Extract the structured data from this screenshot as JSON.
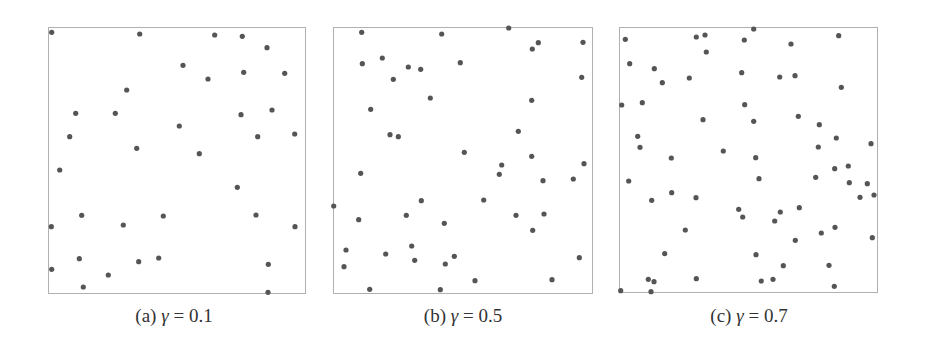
{
  "figure": {
    "dot_color": "#555555",
    "frame_color": "#b0b0b0",
    "dot_radius": 2.6
  },
  "chart_data": [
    {
      "type": "scatter",
      "title": "",
      "caption": {
        "label": "(a)",
        "symbol": "γ",
        "equals": "=",
        "value": "0.1"
      },
      "gamma": 0.1,
      "frame": {
        "x": 48,
        "y": 27,
        "w": 257,
        "h": 266
      },
      "axes": "none",
      "grid": false,
      "legend": "none",
      "points": [
        [
          51.7,
          32.3
        ],
        [
          139.7,
          34
        ],
        [
          214.7,
          35
        ],
        [
          242.3,
          36.3
        ],
        [
          267,
          47.7
        ],
        [
          183,
          65.3
        ],
        [
          243.7,
          72.3
        ],
        [
          284.7,
          73.3
        ],
        [
          208,
          79
        ],
        [
          126.7,
          90
        ],
        [
          75.7,
          113.3
        ],
        [
          115.3,
          113.3
        ],
        [
          272,
          110
        ],
        [
          241,
          114.7
        ],
        [
          179.3,
          126
        ],
        [
          69.7,
          136.7
        ],
        [
          257.7,
          136.7
        ],
        [
          294.7,
          134
        ],
        [
          136.7,
          148.3
        ],
        [
          199.3,
          153.7
        ],
        [
          59.7,
          170
        ],
        [
          237.3,
          187.3
        ],
        [
          81.7,
          215.3
        ],
        [
          163.3,
          216
        ],
        [
          256,
          215
        ],
        [
          51.3,
          226.7
        ],
        [
          123.3,
          225
        ],
        [
          295,
          226.7
        ],
        [
          79.3,
          258.7
        ],
        [
          138.7,
          261.7
        ],
        [
          158.7,
          258
        ],
        [
          268.3,
          264.3
        ],
        [
          51.7,
          269.3
        ],
        [
          108.3,
          275
        ],
        [
          83.3,
          287
        ],
        [
          268,
          292.3
        ]
      ]
    },
    {
      "type": "scatter",
      "title": "",
      "caption": {
        "label": "(b)",
        "symbol": "γ",
        "equals": "=",
        "value": "0.5"
      },
      "gamma": 0.5,
      "frame": {
        "x": 333,
        "y": 27,
        "w": 259,
        "h": 266
      },
      "axes": "none",
      "grid": false,
      "legend": "none",
      "points": [
        [
          361.7,
          32.3
        ],
        [
          441.7,
          34
        ],
        [
          508.7,
          28
        ],
        [
          538.3,
          42.7
        ],
        [
          532.3,
          49
        ],
        [
          583,
          42.3
        ],
        [
          362.3,
          63.7
        ],
        [
          382.3,
          58
        ],
        [
          408.3,
          67
        ],
        [
          420.7,
          69.3
        ],
        [
          460.3,
          62.7
        ],
        [
          393.3,
          79.3
        ],
        [
          581.7,
          77.3
        ],
        [
          430.3,
          98
        ],
        [
          531.7,
          100.3
        ],
        [
          370.7,
          109.3
        ],
        [
          518.3,
          131.3
        ],
        [
          390,
          134.7
        ],
        [
          398.3,
          136.7
        ],
        [
          464.3,
          152.3
        ],
        [
          531.7,
          156.3
        ],
        [
          501.7,
          165
        ],
        [
          584,
          163.7
        ],
        [
          360.7,
          173.3
        ],
        [
          499.3,
          174.3
        ],
        [
          543,
          180.7
        ],
        [
          573.3,
          179
        ],
        [
          333.7,
          206
        ],
        [
          421.3,
          200.7
        ],
        [
          483.7,
          200
        ],
        [
          358.7,
          219.7
        ],
        [
          406.3,
          215.3
        ],
        [
          444.3,
          223.3
        ],
        [
          516,
          215.3
        ],
        [
          544,
          214
        ],
        [
          532.7,
          230.3
        ],
        [
          346,
          250
        ],
        [
          411.7,
          246
        ],
        [
          385.7,
          254
        ],
        [
          414.7,
          260.3
        ],
        [
          454.3,
          256.3
        ],
        [
          344,
          266.7
        ],
        [
          445.3,
          264
        ],
        [
          579.3,
          257.7
        ],
        [
          475,
          280.7
        ],
        [
          552,
          279.7
        ],
        [
          369.7,
          289.3
        ],
        [
          440.3,
          289.7
        ]
      ]
    },
    {
      "type": "scatter",
      "title": "",
      "caption": {
        "label": "(c)",
        "symbol": "γ",
        "equals": "=",
        "value": "0.7"
      },
      "gamma": 0.7,
      "frame": {
        "x": 619,
        "y": 27,
        "w": 258,
        "h": 265
      },
      "axes": "none",
      "grid": false,
      "legend": "none",
      "points": [
        [
          625.3,
          39.3
        ],
        [
          696.3,
          37
        ],
        [
          705,
          35
        ],
        [
          753.7,
          29
        ],
        [
          744.3,
          40
        ],
        [
          791,
          44
        ],
        [
          838.7,
          35.7
        ],
        [
          706.3,
          52
        ],
        [
          629.7,
          63.7
        ],
        [
          654.3,
          68.7
        ],
        [
          662.3,
          82.7
        ],
        [
          689.3,
          78
        ],
        [
          741.7,
          72.7
        ],
        [
          779.7,
          77
        ],
        [
          795,
          75.7
        ],
        [
          841.3,
          87.3
        ],
        [
          621.7,
          105
        ],
        [
          642.3,
          102.7
        ],
        [
          744.7,
          104.7
        ],
        [
          703,
          119.7
        ],
        [
          753.7,
          121.3
        ],
        [
          798.3,
          116.3
        ],
        [
          819.3,
          124.7
        ],
        [
          637.7,
          136.3
        ],
        [
          640,
          147.3
        ],
        [
          836.3,
          138
        ],
        [
          818.3,
          147
        ],
        [
          871,
          143.7
        ],
        [
          723.3,
          151
        ],
        [
          671.3,
          158
        ],
        [
          755.7,
          157.7
        ],
        [
          834.7,
          168.7
        ],
        [
          848.3,
          166
        ],
        [
          628.7,
          181
        ],
        [
          759,
          178.7
        ],
        [
          815.7,
          177.3
        ],
        [
          849.3,
          182.7
        ],
        [
          867.3,
          183.7
        ],
        [
          671.7,
          192.7
        ],
        [
          651.7,
          200.3
        ],
        [
          696,
          197.7
        ],
        [
          860,
          197.3
        ],
        [
          874,
          195
        ],
        [
          738.7,
          209.3
        ],
        [
          742.7,
          217
        ],
        [
          780.3,
          212
        ],
        [
          799.3,
          207.7
        ],
        [
          774.7,
          221
        ],
        [
          685.3,
          230
        ],
        [
          835,
          227.3
        ],
        [
          821.3,
          233
        ],
        [
          795.3,
          240.3
        ],
        [
          872.3,
          237.7
        ],
        [
          664.7,
          253.7
        ],
        [
          756,
          254.7
        ],
        [
          783.3,
          265.7
        ],
        [
          829,
          265.3
        ],
        [
          648.3,
          279.3
        ],
        [
          654,
          281.7
        ],
        [
          696.3,
          278.7
        ],
        [
          761.3,
          281
        ],
        [
          773,
          279.3
        ],
        [
          834.3,
          286.3
        ],
        [
          620.7,
          290.7
        ],
        [
          651,
          291.7
        ]
      ]
    }
  ]
}
